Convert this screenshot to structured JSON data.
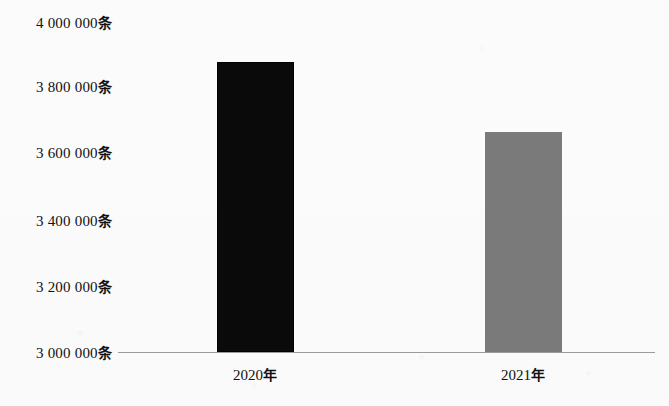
{
  "chart_data": {
    "type": "bar",
    "title": "",
    "xlabel": "",
    "ylabel": "",
    "unit_suffix": "条",
    "categories": [
      "2020年",
      "2021年"
    ],
    "values": [
      3880000,
      3670000
    ],
    "series": [
      {
        "name": "",
        "values": [
          3880000,
          3670000
        ],
        "colors": [
          "#0a0a0a",
          "#7a7a7a"
        ]
      }
    ],
    "ylim": [
      3000000,
      4000000
    ],
    "ytick_step": 200000,
    "ytick_labels": [
      "4 000 000条",
      "3 800 000条",
      "3 600 000条",
      "3 400 000条",
      "3 200 000条",
      "3 000 000条"
    ],
    "ytick_values": [
      4000000,
      3800000,
      3600000,
      3400000,
      3200000,
      3000000
    ],
    "grid": false,
    "legend": "none",
    "axis_line_color": "#9a9a9a",
    "background": "#fdfdfd"
  },
  "yticks": [
    {
      "label_num": "4 000 000",
      "label_unit": "条"
    },
    {
      "label_num": "3 800 000",
      "label_unit": "条"
    },
    {
      "label_num": "3 600 000",
      "label_unit": "条"
    },
    {
      "label_num": "3 400 000",
      "label_unit": "条"
    },
    {
      "label_num": "3 200 000",
      "label_unit": "条"
    },
    {
      "label_num": "3 000 000",
      "label_unit": "条"
    }
  ],
  "xlabels": [
    {
      "num": "2020",
      "unit": "年"
    },
    {
      "num": "2021",
      "unit": "年"
    }
  ]
}
